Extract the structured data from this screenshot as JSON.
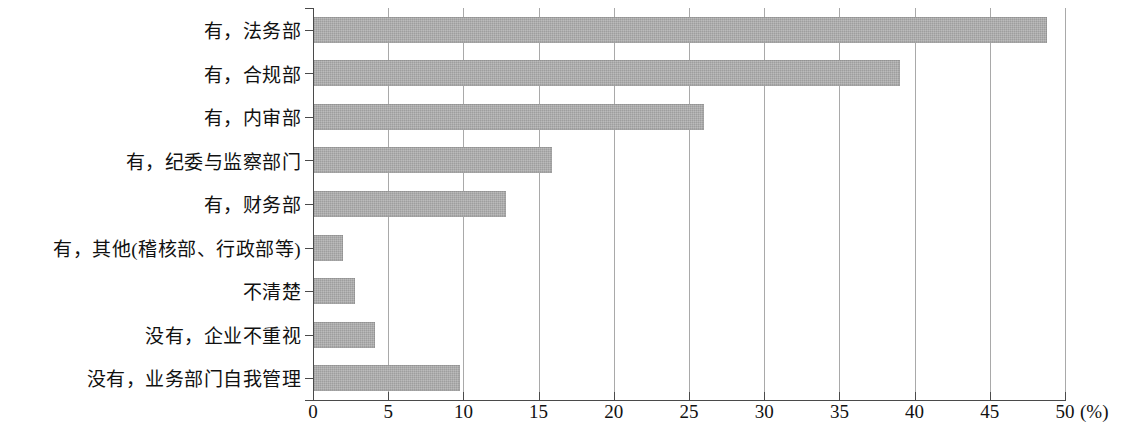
{
  "chart_data": {
    "type": "bar",
    "orientation": "horizontal",
    "title": "",
    "subtitle": "",
    "xlabel": "(%)",
    "ylabel": "",
    "xlim": [
      0,
      50
    ],
    "xticks": [
      0,
      5,
      10,
      15,
      20,
      25,
      30,
      35,
      40,
      45,
      50
    ],
    "xtick_labels": [
      "0",
      "5",
      "10",
      "15",
      "20",
      "25",
      "30",
      "35",
      "40",
      "45",
      "50"
    ],
    "grid": true,
    "legend": null,
    "bar_color": "#a9a9a9",
    "categories": [
      "有，法务部",
      "有，合规部",
      "有，内审部",
      "有，纪委与监察部门",
      "有，财务部",
      "有，其他(稽核部、行政部等)",
      "不清楚",
      "没有，企业不重视",
      "没有，业务部门自我管理"
    ],
    "values": [
      48.8,
      39.0,
      26.0,
      15.9,
      12.8,
      2.0,
      2.8,
      4.1,
      9.8
    ],
    "unit": "%"
  }
}
